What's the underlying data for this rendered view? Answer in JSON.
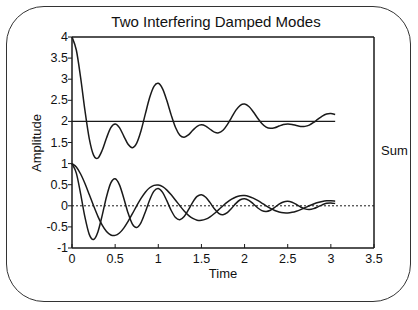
{
  "chart_data": {
    "type": "line",
    "title": "Two Interfering Damped Modes",
    "xlabel": "Time",
    "ylabel": "Amplitude",
    "xlim": [
      0,
      3.5
    ],
    "ylim": [
      -1,
      4
    ],
    "xticks": [
      "0",
      "0.5",
      "1",
      "1.5",
      "2",
      "2.5",
      "3",
      "3.5"
    ],
    "yticks": [
      "-1",
      "-0.5",
      "0",
      "0.5",
      "1",
      "1.5",
      "2",
      "2.5",
      "3",
      "3.5",
      "4"
    ],
    "grid": false,
    "legend": "none",
    "annotations": [
      {
        "text": "Sum",
        "x": 3.15,
        "y": 2
      }
    ],
    "reference_lines": [
      {
        "name": "sum-baseline",
        "y": 2,
        "style": "solid",
        "x_range": [
          0,
          3.05
        ]
      },
      {
        "name": "zero-line",
        "y": 0,
        "style": "dotted",
        "x_range": [
          0,
          3.5
        ]
      }
    ],
    "x": [
      0,
      0.05,
      0.1,
      0.15,
      0.2,
      0.25,
      0.3,
      0.35,
      0.4,
      0.45,
      0.5,
      0.55,
      0.6,
      0.65,
      0.7,
      0.75,
      0.8,
      0.85,
      0.9,
      0.95,
      1.0,
      1.05,
      1.1,
      1.15,
      1.2,
      1.25,
      1.3,
      1.35,
      1.4,
      1.45,
      1.5,
      1.55,
      1.6,
      1.65,
      1.7,
      1.75,
      1.8,
      1.85,
      1.9,
      1.95,
      2.0,
      2.05,
      2.1,
      2.15,
      2.2,
      2.25,
      2.3,
      2.35,
      2.4,
      2.45,
      2.5,
      2.55,
      2.6,
      2.65,
      2.7,
      2.75,
      2.8,
      2.85,
      2.9,
      2.95,
      3.0,
      3.05
    ],
    "series": [
      {
        "name": "Mode 1 (fast)",
        "values": [
          1,
          0.774,
          0.283,
          -0.27,
          -0.677,
          -0.8,
          -0.619,
          -0.226,
          0.216,
          0.542,
          0.641,
          0.496,
          0.181,
          -0.173,
          -0.434,
          -0.513,
          -0.397,
          -0.145,
          0.139,
          0.347,
          0.411,
          0.318,
          0.116,
          -0.111,
          -0.278,
          -0.329,
          -0.254,
          -0.093,
          0.089,
          0.223,
          0.263,
          0.204,
          0.074,
          -0.071,
          -0.178,
          -0.211,
          -0.163,
          -0.06,
          0.057,
          0.143,
          0.169,
          0.131,
          0.048,
          -0.046,
          -0.114,
          -0.135,
          -0.105,
          -0.038,
          0.037,
          0.092,
          0.108,
          0.084,
          0.031,
          -0.029,
          -0.073,
          -0.087,
          -0.067,
          -0.025,
          0.023,
          0.059,
          0.069,
          0.054
        ]
      },
      {
        "name": "Mode 2 (slow)",
        "values": [
          1,
          0.918,
          0.754,
          0.529,
          0.268,
          0,
          -0.25,
          -0.459,
          -0.609,
          -0.691,
          -0.701,
          -0.644,
          -0.528,
          -0.37,
          -0.188,
          0,
          0.175,
          0.322,
          0.427,
          0.484,
          0.492,
          0.452,
          0.371,
          0.26,
          0.132,
          0,
          -0.123,
          -0.226,
          -0.299,
          -0.34,
          -0.345,
          -0.317,
          -0.26,
          -0.182,
          -0.092,
          0,
          0.086,
          0.158,
          0.21,
          0.238,
          0.242,
          0.222,
          0.182,
          0.128,
          0.065,
          0,
          -0.06,
          -0.111,
          -0.147,
          -0.167,
          -0.169,
          -0.155,
          -0.128,
          -0.09,
          -0.045,
          0,
          0.042,
          0.078,
          0.103,
          0.117,
          0.119,
          0.109
        ]
      },
      {
        "name": "Sum",
        "offset": 2,
        "values": [
          4,
          3.692,
          3.037,
          2.259,
          1.591,
          1.2,
          1.131,
          1.315,
          1.607,
          1.851,
          1.94,
          1.852,
          1.653,
          1.457,
          1.378,
          1.487,
          1.778,
          2.177,
          2.566,
          2.831,
          2.903,
          2.77,
          2.487,
          2.149,
          1.854,
          1.671,
          1.623,
          1.681,
          1.79,
          1.883,
          1.918,
          1.887,
          1.814,
          1.747,
          1.73,
          1.789,
          1.923,
          2.098,
          2.267,
          2.381,
          2.411,
          2.353,
          2.23,
          2.082,
          1.951,
          1.865,
          1.835,
          1.851,
          1.89,
          1.925,
          1.939,
          1.929,
          1.903,
          1.881,
          1.882,
          1.913,
          1.975,
          2.053,
          2.126,
          2.176,
          2.188,
          2.163
        ]
      }
    ]
  },
  "layout": {
    "plot_left_px": 72,
    "plot_right_px": 374,
    "plot_top_px": 37,
    "plot_bottom_px": 248,
    "line_color": "#1a1a1a"
  }
}
